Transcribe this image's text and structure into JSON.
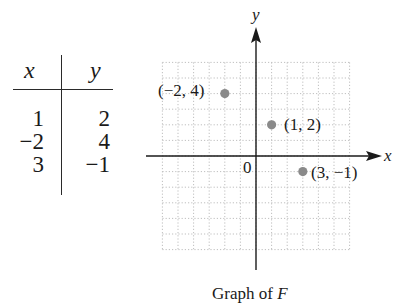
{
  "table": {
    "headers": [
      "x",
      "y"
    ],
    "rows": [
      [
        "1",
        "2"
      ],
      [
        "−2",
        "4"
      ],
      [
        "3",
        "−1"
      ]
    ]
  },
  "graph": {
    "x_axis_label": "x",
    "y_axis_label": "y",
    "origin_label": "0",
    "caption_prefix": "Graph of ",
    "caption_function": "F",
    "colors": {
      "axis": "#1a1a1a",
      "grid": "#b8b8b8",
      "point": "#8a8a8a"
    },
    "points": [
      {
        "x": -2,
        "y": 4,
        "label": "(−2, 4)"
      },
      {
        "x": 1,
        "y": 2,
        "label": "(1, 2)"
      },
      {
        "x": 3,
        "y": -1,
        "label": "(3, −1)"
      }
    ]
  },
  "chart_data": {
    "type": "scatter",
    "title": "Graph of F",
    "xlabel": "x",
    "ylabel": "y",
    "xlim": [
      -6,
      6
    ],
    "ylim": [
      -6,
      6
    ],
    "grid": true,
    "series": [
      {
        "name": "F",
        "x": [
          1,
          -2,
          3
        ],
        "y": [
          2,
          4,
          -1
        ],
        "labels": [
          "(1, 2)",
          "(−2, 4)",
          "(3, −1)"
        ]
      }
    ],
    "table": {
      "columns": [
        "x",
        "y"
      ],
      "rows": [
        [
          1,
          2
        ],
        [
          -2,
          4
        ],
        [
          3,
          -1
        ]
      ]
    }
  }
}
